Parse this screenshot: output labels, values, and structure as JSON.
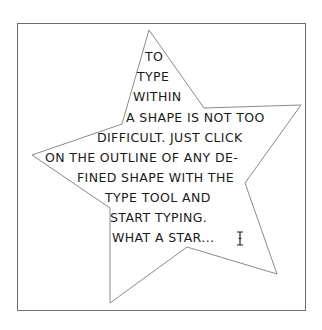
{
  "canvas": {
    "frame_color": "#6e6e6e",
    "star_outline_color": "#8a8a8a",
    "text_color": "#1a1a1a"
  },
  "star": {
    "points": "149,30 204,108 301,105 245,183 277,274 187,247 110,303 110,208 32,155 122,124"
  },
  "text": {
    "lines": [
      "to",
      "type",
      "within",
      "a shape is not too",
      "difficult. Just click",
      "on the outline of any de-",
      "fined shape with the",
      "type tool and",
      "start typing.",
      "What a star..."
    ]
  },
  "cursor": {
    "icon": "i-beam-text-cursor-icon"
  }
}
